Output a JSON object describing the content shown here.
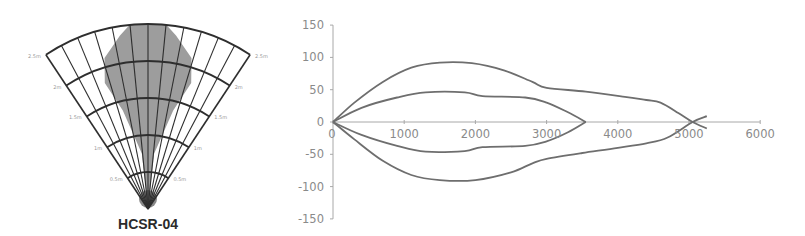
{
  "fan_diagram": {
    "title": "HCSR-04",
    "range_labels": [
      "0.5m",
      "1m",
      "1.5m",
      "2m",
      "2.5m"
    ],
    "apex": [
      148,
      209
    ],
    "ring_step_px": 37,
    "half_angle_deg": 33.5,
    "radial_lines": 13,
    "colors": {
      "grid": "#2e2e2e",
      "fill": "#8c8c8c",
      "apex_fill": "#3a3a3a"
    }
  },
  "chart_data": {
    "type": "line",
    "title": "",
    "xlabel": "",
    "ylabel": "",
    "xlim": [
      0,
      6000
    ],
    "ylim": [
      -150,
      150
    ],
    "x_ticks": [
      0,
      1000,
      2000,
      3000,
      4000,
      5000,
      6000
    ],
    "y_ticks": [
      150,
      100,
      50,
      0,
      -50,
      -100,
      -150
    ],
    "grid": false,
    "legend": null,
    "line_color": "#6e6e6e",
    "series": [
      {
        "name": "outer-upper",
        "points": [
          [
            0,
            0
          ],
          [
            300,
            30
          ],
          [
            700,
            62
          ],
          [
            1100,
            84
          ],
          [
            1500,
            92
          ],
          [
            1950,
            91
          ],
          [
            2400,
            80
          ],
          [
            2800,
            62
          ],
          [
            3000,
            53
          ],
          [
            3550,
            47
          ],
          [
            4100,
            39
          ],
          [
            4400,
            34
          ],
          [
            4600,
            30
          ],
          [
            4850,
            14
          ],
          [
            5050,
            0
          ],
          [
            5250,
            -10
          ]
        ]
      },
      {
        "name": "inner-upper",
        "points": [
          [
            0,
            0
          ],
          [
            400,
            22
          ],
          [
            900,
            38
          ],
          [
            1300,
            46
          ],
          [
            1850,
            46
          ],
          [
            2100,
            40
          ],
          [
            2700,
            38
          ],
          [
            3000,
            30
          ],
          [
            3300,
            15
          ],
          [
            3550,
            0
          ]
        ]
      },
      {
        "name": "inner-lower",
        "points": [
          [
            0,
            0
          ],
          [
            400,
            -20
          ],
          [
            900,
            -37
          ],
          [
            1300,
            -46
          ],
          [
            1850,
            -45
          ],
          [
            2100,
            -39
          ],
          [
            2700,
            -37
          ],
          [
            3000,
            -30
          ],
          [
            3300,
            -16
          ],
          [
            3550,
            0
          ]
        ]
      },
      {
        "name": "outer-lower",
        "points": [
          [
            0,
            0
          ],
          [
            300,
            -27
          ],
          [
            700,
            -60
          ],
          [
            1100,
            -82
          ],
          [
            1500,
            -90
          ],
          [
            2000,
            -90
          ],
          [
            2500,
            -78
          ],
          [
            2800,
            -64
          ],
          [
            3000,
            -57
          ],
          [
            3500,
            -48
          ],
          [
            4000,
            -40
          ],
          [
            4400,
            -33
          ],
          [
            4700,
            -24
          ],
          [
            5050,
            0
          ],
          [
            5250,
            9
          ]
        ]
      }
    ]
  }
}
